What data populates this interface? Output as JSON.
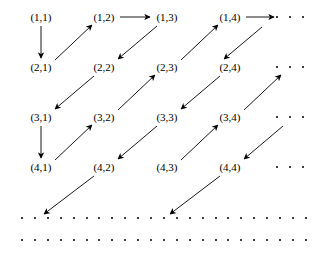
{
  "figure": {
    "width": 323,
    "height": 257,
    "background_color": "#ffffff",
    "ink_color": "#000000"
  },
  "chart_data": {
    "type": "diagram",
    "title": "",
    "grid": {
      "rows": 4,
      "cols": 4,
      "col_x": [
        41,
        104,
        167,
        230
      ],
      "row_y": [
        17,
        67,
        117,
        167
      ],
      "label_format": "(row,col)"
    },
    "nodes": [
      {
        "id": "1-1",
        "label": "(1,1)",
        "row": 1,
        "col": 1,
        "x": 41,
        "y": 17
      },
      {
        "id": "1-2",
        "label": "(1,2)",
        "row": 1,
        "col": 2,
        "x": 104,
        "y": 17
      },
      {
        "id": "1-3",
        "label": "(1,3)",
        "row": 1,
        "col": 3,
        "x": 167,
        "y": 17
      },
      {
        "id": "1-4",
        "label": "(1,4)",
        "row": 1,
        "col": 4,
        "x": 230,
        "y": 17
      },
      {
        "id": "2-1",
        "label": "(2,1)",
        "row": 2,
        "col": 1,
        "x": 41,
        "y": 67
      },
      {
        "id": "2-2",
        "label": "(2,2)",
        "row": 2,
        "col": 2,
        "x": 104,
        "y": 67
      },
      {
        "id": "2-3",
        "label": "(2,3)",
        "row": 2,
        "col": 3,
        "x": 167,
        "y": 67
      },
      {
        "id": "2-4",
        "label": "(2,4)",
        "row": 2,
        "col": 4,
        "x": 230,
        "y": 67
      },
      {
        "id": "3-1",
        "label": "(3,1)",
        "row": 3,
        "col": 1,
        "x": 41,
        "y": 117
      },
      {
        "id": "3-2",
        "label": "(3,2)",
        "row": 3,
        "col": 2,
        "x": 104,
        "y": 117
      },
      {
        "id": "3-3",
        "label": "(3,3)",
        "row": 3,
        "col": 3,
        "x": 167,
        "y": 117
      },
      {
        "id": "3-4",
        "label": "(3,4)",
        "row": 3,
        "col": 4,
        "x": 230,
        "y": 117
      },
      {
        "id": "4-1",
        "label": "(4,1)",
        "row": 4,
        "col": 1,
        "x": 41,
        "y": 167
      },
      {
        "id": "4-2",
        "label": "(4,2)",
        "row": 4,
        "col": 2,
        "x": 104,
        "y": 167
      },
      {
        "id": "4-3",
        "label": "(4,3)",
        "row": 4,
        "col": 3,
        "x": 167,
        "y": 167
      },
      {
        "id": "4-4",
        "label": "(4,4)",
        "row": 4,
        "col": 4,
        "x": 230,
        "y": 167
      }
    ],
    "arrows": [
      {
        "name": "arrow-1-1-to-2-1",
        "from": "(1,1)",
        "to": "(2,1)",
        "direction": "down",
        "x1": 41,
        "y1": 26,
        "x2": 41,
        "y2": 58
      },
      {
        "name": "arrow-2-1-to-1-2",
        "from": "(2,1)",
        "to": "(1,2)",
        "direction": "up-right",
        "x1": 55,
        "y1": 60,
        "x2": 92,
        "y2": 25
      },
      {
        "name": "arrow-1-2-to-1-3",
        "from": "(1,2)",
        "to": "(1,3)",
        "direction": "right",
        "x1": 120,
        "y1": 17,
        "x2": 150,
        "y2": 17
      },
      {
        "name": "arrow-1-3-to-2-2",
        "from": "(1,3)",
        "to": "(2,2)",
        "direction": "down-left",
        "x1": 157,
        "y1": 26,
        "x2": 118,
        "y2": 59
      },
      {
        "name": "arrow-2-2-to-3-1",
        "from": "(2,2)",
        "to": "(3,1)",
        "direction": "down-left",
        "x1": 94,
        "y1": 76,
        "x2": 55,
        "y2": 109
      },
      {
        "name": "arrow-3-1-to-4-1",
        "from": "(3,1)",
        "to": "(4,1)",
        "direction": "down",
        "x1": 41,
        "y1": 126,
        "x2": 41,
        "y2": 158
      },
      {
        "name": "arrow-4-1-to-3-2",
        "from": "(4,1)",
        "to": "(3,2)",
        "direction": "up-right",
        "x1": 55,
        "y1": 160,
        "x2": 92,
        "y2": 125
      },
      {
        "name": "arrow-3-2-to-2-3",
        "from": "(3,2)",
        "to": "(2,3)",
        "direction": "up-right",
        "x1": 118,
        "y1": 110,
        "x2": 155,
        "y2": 75
      },
      {
        "name": "arrow-2-3-to-1-4",
        "from": "(2,3)",
        "to": "(1,4)",
        "direction": "up-right",
        "x1": 181,
        "y1": 60,
        "x2": 218,
        "y2": 25
      },
      {
        "name": "arrow-1-4-to-ellipsis",
        "from": "(1,4)",
        "to": "ellipsis",
        "direction": "right",
        "x1": 246,
        "y1": 17,
        "x2": 274,
        "y2": 17
      },
      {
        "name": "arrow-1-5-to-2-4",
        "from": "ellipsis",
        "to": "(2,4)",
        "direction": "down-left",
        "x1": 262,
        "y1": 27,
        "x2": 224,
        "y2": 59
      },
      {
        "name": "arrow-2-4-to-3-3",
        "from": "(2,4)",
        "to": "(3,3)",
        "direction": "down-left",
        "x1": 220,
        "y1": 76,
        "x2": 181,
        "y2": 109
      },
      {
        "name": "arrow-3-3-to-4-2",
        "from": "(3,3)",
        "to": "(4,2)",
        "direction": "down-left",
        "x1": 157,
        "y1": 126,
        "x2": 118,
        "y2": 159
      },
      {
        "name": "arrow-4-2-to-dots",
        "from": "(4,2)",
        "to": "dot-row",
        "direction": "down-left",
        "x1": 94,
        "y1": 176,
        "x2": 44,
        "y2": 214
      },
      {
        "name": "arrow-4-3-to-3-4",
        "from": "(4,3)",
        "to": "(3,4)",
        "direction": "up-right",
        "x1": 181,
        "y1": 160,
        "x2": 218,
        "y2": 125
      },
      {
        "name": "arrow-3-4-to-2-5",
        "from": "(3,4)",
        "to": "ellipsis",
        "direction": "up-right",
        "x1": 244,
        "y1": 110,
        "x2": 281,
        "y2": 75
      },
      {
        "name": "arrow-2-5-to-4-4",
        "from": "ellipsis",
        "to": "(4,4)",
        "direction": "down-left",
        "x1": 283,
        "y1": 126,
        "x2": 244,
        "y2": 159
      },
      {
        "name": "arrow-4-4-to-dots",
        "from": "(4,4)",
        "to": "dot-row",
        "direction": "down-left",
        "x1": 220,
        "y1": 176,
        "x2": 170,
        "y2": 214
      }
    ],
    "row_ellipses": [
      {
        "name": "row-1-ellipsis",
        "row": 1,
        "y": 17,
        "dots_x": [
          277,
          290,
          303
        ]
      },
      {
        "name": "row-2-ellipsis",
        "row": 2,
        "y": 67,
        "dots_x": [
          277,
          290,
          303
        ]
      },
      {
        "name": "row-3-ellipsis",
        "row": 3,
        "y": 117,
        "dots_x": [
          277,
          290,
          303
        ]
      },
      {
        "name": "row-4-ellipsis",
        "row": 4,
        "y": 167,
        "dots_x": [
          277,
          290,
          303
        ]
      }
    ],
    "dot_rows": [
      {
        "name": "dot-row-5",
        "y": 218,
        "start_x": 22,
        "spacing": 12.9,
        "count": 23
      },
      {
        "name": "dot-row-6",
        "y": 240,
        "start_x": 22,
        "spacing": 12.9,
        "count": 23
      }
    ],
    "dot_color": "#000000",
    "arrow_color": "#000000"
  }
}
